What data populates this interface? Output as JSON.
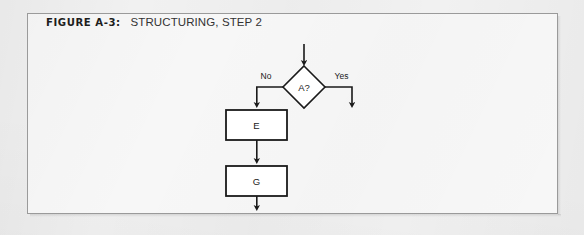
{
  "figure": {
    "label": "FIGURE A-3:",
    "caption": "STRUCTURING, STEP 2"
  },
  "colors": {
    "page_background": "#f1f1f1",
    "frame_background": "#f7f7f7",
    "frame_border": "#9a9a9a",
    "stroke": "#1a1a1a",
    "node_fill": "#ffffff",
    "text": "#1a1a1a"
  },
  "diagram": {
    "type": "flowchart",
    "entry_arrow": {
      "name": "entry-arrow",
      "from": [
        304,
        44
      ],
      "to": [
        304,
        66
      ]
    },
    "nodes": [
      {
        "id": "decision-a",
        "shape": "diamond",
        "label": "A?",
        "center": [
          304,
          87
        ],
        "half_width": 21,
        "half_height": 21
      },
      {
        "id": "process-e",
        "shape": "rectangle",
        "label": "E",
        "x": 226,
        "y": 110,
        "width": 61,
        "height": 30
      },
      {
        "id": "process-g",
        "shape": "rectangle",
        "label": "G",
        "x": 226,
        "y": 166,
        "width": 61,
        "height": 30
      }
    ],
    "edges": [
      {
        "id": "edge-no",
        "label": "No",
        "label_position": [
          266,
          77
        ],
        "from": "decision-a",
        "to": "process-e",
        "path": "M 283 87 L 256 87 L 256 108"
      },
      {
        "id": "edge-yes",
        "label": "Yes",
        "label_position": [
          341,
          77
        ],
        "from": "decision-a",
        "to": "exit-yes",
        "path": "M 325 87 L 352 87 L 352 108"
      },
      {
        "id": "edge-e-to-g",
        "label": "",
        "from": "process-e",
        "to": "process-g",
        "path": "M 256 140 L 256 164"
      },
      {
        "id": "edge-g-exit",
        "label": "",
        "from": "process-g",
        "to": "exit-bottom",
        "path": "M 256 196 L 256 211"
      }
    ]
  }
}
